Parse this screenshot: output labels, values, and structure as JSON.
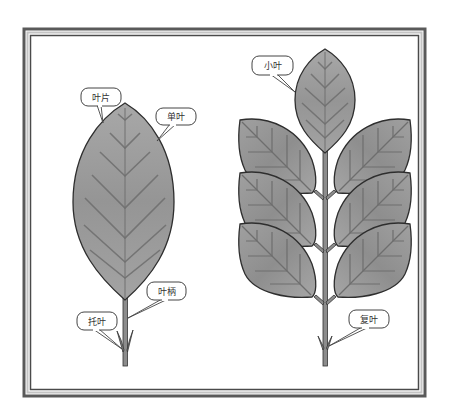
{
  "diagram": {
    "title": "",
    "colors": {
      "frame_dark": "#555555",
      "frame_light": "#bbbbbb",
      "leaf_fill": "#9a9a9a",
      "leaf_light": "#b5b5b5",
      "leaf_outline": "#2e2e2e",
      "vein": "#6e6e6e",
      "stem": "#8a8a8a",
      "callout_border": "#444444",
      "callout_fill": "#ffffff"
    },
    "simple_leaf": {
      "name": "单叶",
      "labels": {
        "blade": "叶片",
        "simple_leaf": "单叶",
        "petiole": "叶柄",
        "stipule": "托叶"
      }
    },
    "compound_leaf": {
      "name": "复叶",
      "labels": {
        "leaflet": "小叶",
        "compound_leaf": "复叶"
      },
      "leaflet_count": 7
    }
  }
}
